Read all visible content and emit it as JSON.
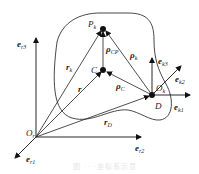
{
  "diagram": {
    "reference_frame": {
      "origin_label": "O",
      "origin_sub": "r",
      "axes": [
        {
          "label": "e",
          "sub": "r1"
        },
        {
          "label": "e",
          "sub": "r2"
        },
        {
          "label": "e",
          "sub": "r3"
        }
      ]
    },
    "body_frame": {
      "origin_label": "O",
      "origin_sub": "k",
      "point_label": "D",
      "axes": [
        {
          "label": "e",
          "sub": "k1"
        },
        {
          "label": "e",
          "sub": "k2"
        },
        {
          "label": "e",
          "sub": "k3"
        }
      ]
    },
    "points": [
      {
        "label": "P",
        "sub": "k"
      },
      {
        "label": "C",
        "sub": ""
      },
      {
        "label": "D",
        "sub": ""
      }
    ],
    "vectors": [
      {
        "label": "r",
        "sub": "k"
      },
      {
        "label": "r",
        "sub": ""
      },
      {
        "label": "r",
        "sub": "D"
      },
      {
        "label": "ρ",
        "sub": "CP"
      },
      {
        "label": "ρ",
        "sub": "k"
      },
      {
        "label": "ρ",
        "sub": "C"
      }
    ],
    "caption": "图 ·· ·坐标系示意"
  }
}
